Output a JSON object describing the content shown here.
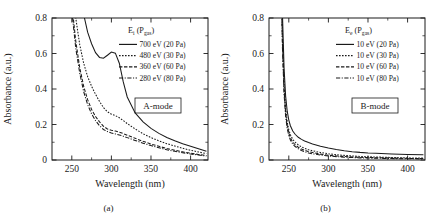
{
  "figure": {
    "panels": [
      {
        "caption": "(a)",
        "mode_label": "A-mode",
        "legend_header_symbol": "E",
        "legend_header_sub": "i",
        "legend_header_paren_open": "(P",
        "legend_header_paren_sub": "gas",
        "legend_header_paren_close": ")",
        "entries": [
          {
            "label": "700 eV (20 Pa)",
            "style": "solid"
          },
          {
            "label": "480 eV (30 Pa)",
            "style": "fine-dashed"
          },
          {
            "label": "360 eV (60 Pa)",
            "style": "dashed"
          },
          {
            "label": "280 eV (80 Pa)",
            "style": "dash-dot"
          }
        ]
      },
      {
        "caption": "(b)",
        "mode_label": "B-mode",
        "legend_header_symbol": "E",
        "legend_header_sub": "e",
        "legend_header_paren_open": "(P",
        "legend_header_paren_sub": "gas",
        "legend_header_paren_close": ")",
        "entries": [
          {
            "label": "10 eV (20 Pa)",
            "style": "solid"
          },
          {
            "label": "10 eV (30 Pa)",
            "style": "fine-dashed"
          },
          {
            "label": "10 eV (60 Pa)",
            "style": "dashed"
          },
          {
            "label": "10 eV (80 Pa)",
            "style": "dash-dot"
          }
        ]
      }
    ]
  },
  "chart_data": [
    {
      "type": "line",
      "title": "",
      "panel_label": "(a)",
      "annotation": "A-mode",
      "xlabel": "Wavelength (nm)",
      "ylabel": "Absorbance (a.u.)",
      "xlim": [
        225,
        422
      ],
      "ylim": [
        0,
        0.8
      ],
      "xticks": [
        250,
        300,
        350,
        400
      ],
      "yticks": [
        0,
        0.2,
        0.4,
        0.6,
        0.8
      ],
      "xminor_step": 25,
      "yminor_step": 0.1,
      "grid": false,
      "legend_position": "top-right",
      "legend_title": "E_i (P_gas)",
      "x": [
        240,
        245,
        250,
        255,
        260,
        265,
        270,
        275,
        280,
        285,
        290,
        295,
        300,
        305,
        310,
        315,
        320,
        330,
        340,
        350,
        360,
        370,
        380,
        390,
        400,
        410,
        420
      ],
      "series": [
        {
          "name": "700 eV (20 Pa)",
          "style": "solid",
          "values": [
            2.3,
            1.85,
            1.45,
            1.15,
            0.95,
            0.82,
            0.72,
            0.655,
            0.605,
            0.578,
            0.573,
            0.59,
            0.608,
            0.602,
            0.545,
            0.44,
            0.355,
            0.265,
            0.215,
            0.178,
            0.15,
            0.127,
            0.108,
            0.091,
            0.077,
            0.063,
            0.05
          ]
        },
        {
          "name": "480 eV (30 Pa)",
          "style": "fine-dashed",
          "values": [
            1.75,
            1.35,
            1.02,
            0.8,
            0.65,
            0.545,
            0.47,
            0.415,
            0.37,
            0.33,
            0.295,
            0.272,
            0.258,
            0.25,
            0.238,
            0.222,
            0.205,
            0.175,
            0.148,
            0.126,
            0.108,
            0.092,
            0.079,
            0.066,
            0.055,
            0.045,
            0.036
          ]
        },
        {
          "name": "360 eV (60 Pa)",
          "style": "dashed",
          "values": [
            1.55,
            1.18,
            0.88,
            0.67,
            0.52,
            0.415,
            0.34,
            0.285,
            0.245,
            0.215,
            0.19,
            0.175,
            0.168,
            0.163,
            0.157,
            0.149,
            0.14,
            0.122,
            0.105,
            0.09,
            0.077,
            0.065,
            0.055,
            0.046,
            0.038,
            0.031,
            0.025
          ]
        },
        {
          "name": "280 eV (80 Pa)",
          "style": "dash-dot",
          "values": [
            1.5,
            1.13,
            0.84,
            0.63,
            0.49,
            0.385,
            0.312,
            0.26,
            0.222,
            0.193,
            0.172,
            0.16,
            0.152,
            0.147,
            0.141,
            0.134,
            0.126,
            0.11,
            0.095,
            0.081,
            0.069,
            0.058,
            0.049,
            0.041,
            0.034,
            0.028,
            0.022
          ]
        }
      ]
    },
    {
      "type": "line",
      "title": "",
      "panel_label": "(b)",
      "annotation": "B-mode",
      "xlabel": "Wavelength (nm)",
      "ylabel": "Absorbance (a.u.)",
      "xlim": [
        225,
        422
      ],
      "ylim": [
        0,
        0.8
      ],
      "xticks": [
        250,
        300,
        350,
        400
      ],
      "yticks": [
        0,
        0.2,
        0.4,
        0.6,
        0.8
      ],
      "xminor_step": 25,
      "yminor_step": 0.1,
      "grid": false,
      "legend_position": "top-right",
      "legend_title": "E_e (P_gas)",
      "x": [
        238,
        240,
        242,
        244,
        246,
        248,
        250,
        252,
        255,
        258,
        262,
        266,
        270,
        275,
        280,
        290,
        300,
        310,
        320,
        330,
        340,
        350,
        360,
        380,
        400,
        420
      ],
      "series": [
        {
          "name": "10 eV (20 Pa)",
          "style": "solid",
          "values": [
            2.2,
            1.35,
            0.82,
            0.52,
            0.36,
            0.275,
            0.225,
            0.193,
            0.163,
            0.145,
            0.128,
            0.116,
            0.107,
            0.098,
            0.09,
            0.077,
            0.067,
            0.059,
            0.052,
            0.047,
            0.043,
            0.04,
            0.038,
            0.034,
            0.031,
            0.029
          ]
        },
        {
          "name": "10 eV (30 Pa)",
          "style": "fine-dashed",
          "values": [
            2.0,
            1.2,
            0.7,
            0.43,
            0.29,
            0.215,
            0.17,
            0.142,
            0.116,
            0.1,
            0.085,
            0.074,
            0.066,
            0.058,
            0.052,
            0.042,
            0.035,
            0.03,
            0.026,
            0.023,
            0.02,
            0.018,
            0.017,
            0.014,
            0.012,
            0.011
          ]
        },
        {
          "name": "10 eV (60 Pa)",
          "style": "dashed",
          "values": [
            1.95,
            1.15,
            0.66,
            0.4,
            0.265,
            0.195,
            0.152,
            0.125,
            0.101,
            0.086,
            0.072,
            0.062,
            0.055,
            0.047,
            0.042,
            0.033,
            0.027,
            0.023,
            0.02,
            0.017,
            0.015,
            0.014,
            0.013,
            0.011,
            0.009,
            0.008
          ]
        },
        {
          "name": "10 eV (80 Pa)",
          "style": "dash-dot",
          "values": [
            1.9,
            1.1,
            0.63,
            0.375,
            0.245,
            0.178,
            0.138,
            0.112,
            0.09,
            0.076,
            0.063,
            0.054,
            0.047,
            0.04,
            0.035,
            0.028,
            0.023,
            0.019,
            0.016,
            0.014,
            0.012,
            0.011,
            0.01,
            0.008,
            0.007,
            0.006
          ]
        }
      ]
    }
  ]
}
